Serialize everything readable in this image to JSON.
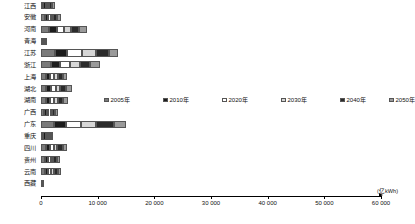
{
  "chart_data": {
    "type": "bar",
    "orientation": "horizontal",
    "stacked": true,
    "title": "",
    "xlabel": "(亿kWh)",
    "ylabel": "",
    "xlim": [
      0,
      60000
    ],
    "grid": false,
    "legend_position": "middle-center",
    "xticks": [
      0,
      10000,
      20000,
      30000,
      40000,
      50000,
      60000
    ],
    "xticklabels": [
      "0",
      "10 000",
      "20 000",
      "30 000",
      "40 000",
      "50 000",
      "60 000"
    ],
    "categories": [
      "江西",
      "安徽",
      "河南",
      "青海",
      "江苏",
      "浙江",
      "上海",
      "湖北",
      "湖南",
      "广西",
      "广东",
      "重庆",
      "四川",
      "贵州",
      "云南",
      "西藏"
    ],
    "series": [
      {
        "name": "2005年",
        "color": "#7a7a7a",
        "values": [
          420,
          620,
          1450,
          270,
          2480,
          1800,
          900,
          950,
          840,
          550,
          2300,
          420,
          820,
          620,
          640,
          40
        ]
      },
      {
        "name": "2010年",
        "color": "#1c1c1c",
        "values": [
          380,
          560,
          1380,
          190,
          2150,
          1600,
          760,
          880,
          760,
          500,
          2050,
          380,
          740,
          560,
          580,
          30
        ]
      },
      {
        "name": "2020年",
        "color": "#ffffff",
        "values": [
          330,
          500,
          1250,
          130,
          2600,
          1750,
          700,
          800,
          700,
          450,
          2750,
          300,
          680,
          500,
          520,
          20
        ]
      },
      {
        "name": "2030年",
        "color": "#d6d6d6",
        "values": [
          280,
          460,
          1180,
          100,
          2450,
          1650,
          620,
          760,
          660,
          420,
          2600,
          260,
          640,
          460,
          480,
          15
        ]
      },
      {
        "name": "2040年",
        "color": "#2b2b2b",
        "values": [
          520,
          700,
          1520,
          80,
          2300,
          1900,
          820,
          1050,
          900,
          600,
          3150,
          340,
          920,
          680,
          700,
          12
        ]
      },
      {
        "name": "2050年",
        "color": "#9a9a9a",
        "values": [
          460,
          640,
          1420,
          60,
          1600,
          1700,
          740,
          980,
          820,
          540,
          2100,
          300,
          860,
          620,
          650,
          10
        ]
      }
    ],
    "totals": [
      2390,
      3480,
      8200,
      830,
      13580,
      10400,
      4540,
      5420,
      4680,
      3060,
      14950,
      2000,
      4660,
      3440,
      3570,
      127
    ]
  }
}
